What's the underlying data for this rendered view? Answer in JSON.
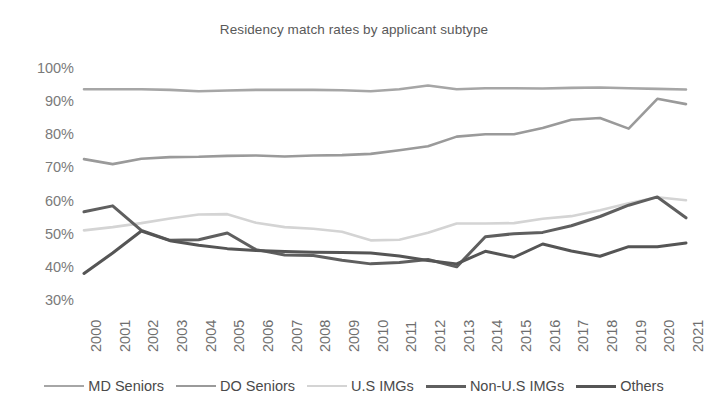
{
  "chart_data": {
    "type": "line",
    "title": "Residency match rates by applicant subtype",
    "xlabel": "",
    "ylabel": "",
    "ylim": [
      30,
      100
    ],
    "ytick_labels": [
      "100%",
      "90%",
      "80%",
      "70%",
      "60%",
      "50%",
      "40%",
      "30%"
    ],
    "ytick_values": [
      100,
      90,
      80,
      70,
      60,
      50,
      40,
      30
    ],
    "grid": false,
    "legend_position": "bottom",
    "unit": "percent",
    "categories": [
      "2000",
      "2001",
      "2002",
      "2003",
      "2004",
      "2005",
      "2006",
      "2007",
      "2008",
      "2009",
      "2010",
      "2011",
      "2012",
      "2013",
      "2014",
      "2015",
      "2016",
      "2017",
      "2018",
      "2019",
      "2020",
      "2021"
    ],
    "x": [
      2000,
      2001,
      2002,
      2003,
      2004,
      2005,
      2006,
      2007,
      2008,
      2009,
      2010,
      2011,
      2012,
      2013,
      2014,
      2015,
      2016,
      2017,
      2018,
      2019,
      2020,
      2021
    ],
    "series": [
      {
        "name": "MD Seniors",
        "color": "#a6a6a6",
        "width": 2.6,
        "values": [
          93.6,
          93.6,
          93.6,
          93.4,
          93.0,
          93.2,
          93.4,
          93.4,
          93.4,
          93.3,
          93.0,
          93.6,
          94.7,
          93.6,
          93.9,
          93.9,
          93.8,
          94.0,
          94.1,
          93.9,
          93.7,
          93.5
        ]
      },
      {
        "name": "DO Seniors",
        "color": "#9a9a9a",
        "width": 2.6,
        "values": [
          72.5,
          71.0,
          72.6,
          73.1,
          73.2,
          73.5,
          73.6,
          73.3,
          73.6,
          73.7,
          74.1,
          75.2,
          76.4,
          79.3,
          80.0,
          80.0,
          81.9,
          84.4,
          84.9,
          81.7,
          90.7,
          89.1
        ]
      },
      {
        "name": "U.S IMGs",
        "color": "#d4d4d4",
        "width": 2.6,
        "values": [
          51.0,
          52.0,
          53.2,
          54.6,
          55.8,
          55.9,
          53.3,
          52.0,
          51.5,
          50.6,
          48.0,
          48.2,
          50.3,
          53.1,
          53.1,
          53.2,
          54.5,
          55.3,
          57.1,
          59.2,
          61.0,
          60.1
        ]
      },
      {
        "name": "Non-U.S IMGs",
        "color": "#5f5f5f",
        "width": 3.0,
        "values": [
          56.6,
          58.4,
          51.0,
          48.0,
          48.2,
          50.2,
          45.2,
          43.6,
          43.4,
          42.0,
          40.9,
          41.3,
          42.2,
          40.0,
          49.1,
          50.0,
          50.4,
          52.4,
          55.2,
          58.6,
          61.1,
          54.8
        ]
      },
      {
        "name": "Others",
        "color": "#555555",
        "width": 3.0,
        "values": [
          38.0,
          44.2,
          50.8,
          47.9,
          46.5,
          45.5,
          44.9,
          44.6,
          44.4,
          44.3,
          44.2,
          43.3,
          41.9,
          40.9,
          44.7,
          42.9,
          46.9,
          44.8,
          43.2,
          46.1,
          46.1,
          47.2
        ]
      }
    ]
  },
  "legend": {
    "items": [
      {
        "label": "MD Seniors"
      },
      {
        "label": "DO Seniors"
      },
      {
        "label": "U.S IMGs"
      },
      {
        "label": "Non-U.S IMGs"
      },
      {
        "label": "Others"
      }
    ]
  }
}
